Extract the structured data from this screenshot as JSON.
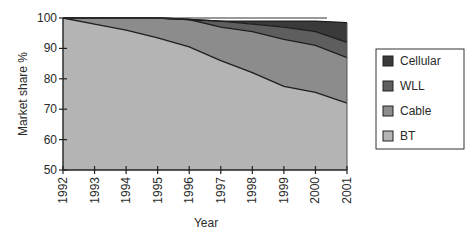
{
  "chart_data": {
    "type": "area",
    "stacked": true,
    "title": "",
    "xlabel": "Year",
    "ylabel": "Market share %",
    "x": [
      1992,
      1993,
      1994,
      1995,
      1996,
      1997,
      1998,
      1999,
      2000,
      2001
    ],
    "ylim": [
      50,
      100
    ],
    "yticks": [
      50,
      60,
      70,
      80,
      90,
      100
    ],
    "xtick_labels": [
      "1992",
      "1993",
      "1994",
      "1995",
      "1996",
      "1997",
      "1998",
      "1999",
      "2000",
      "2001"
    ],
    "ytick_labels": [
      "50",
      "60",
      "70",
      "80",
      "90",
      "100"
    ],
    "grid": false,
    "legend_position": "right",
    "series": [
      {
        "name": "BT",
        "color": "#b4b4b4",
        "values": [
          100,
          98,
          96,
          93.5,
          90.5,
          86,
          82,
          77.5,
          75.5,
          72
        ]
      },
      {
        "name": "Cable",
        "color": "#8c8c8c",
        "values": [
          0,
          2,
          4,
          6.5,
          9,
          11,
          13.5,
          15.5,
          15.5,
          15
        ]
      },
      {
        "name": "WLL",
        "color": "#5e5e5e",
        "values": [
          0,
          0,
          0,
          0,
          0,
          2,
          2.5,
          4,
          4.5,
          5
        ]
      },
      {
        "name": "Cellular",
        "color": "#3a3a3a",
        "values": [
          0,
          0,
          0,
          0,
          0,
          0,
          1,
          2,
          3.5,
          6.5
        ]
      }
    ]
  },
  "legend": {
    "items": [
      {
        "label": "Cellular",
        "color": "#3a3a3a"
      },
      {
        "label": "WLL",
        "color": "#5e5e5e"
      },
      {
        "label": "Cable",
        "color": "#8c8c8c"
      },
      {
        "label": "BT",
        "color": "#b4b4b4"
      }
    ]
  },
  "axes": {
    "x_title": "Year",
    "y_title": "Market share %"
  }
}
